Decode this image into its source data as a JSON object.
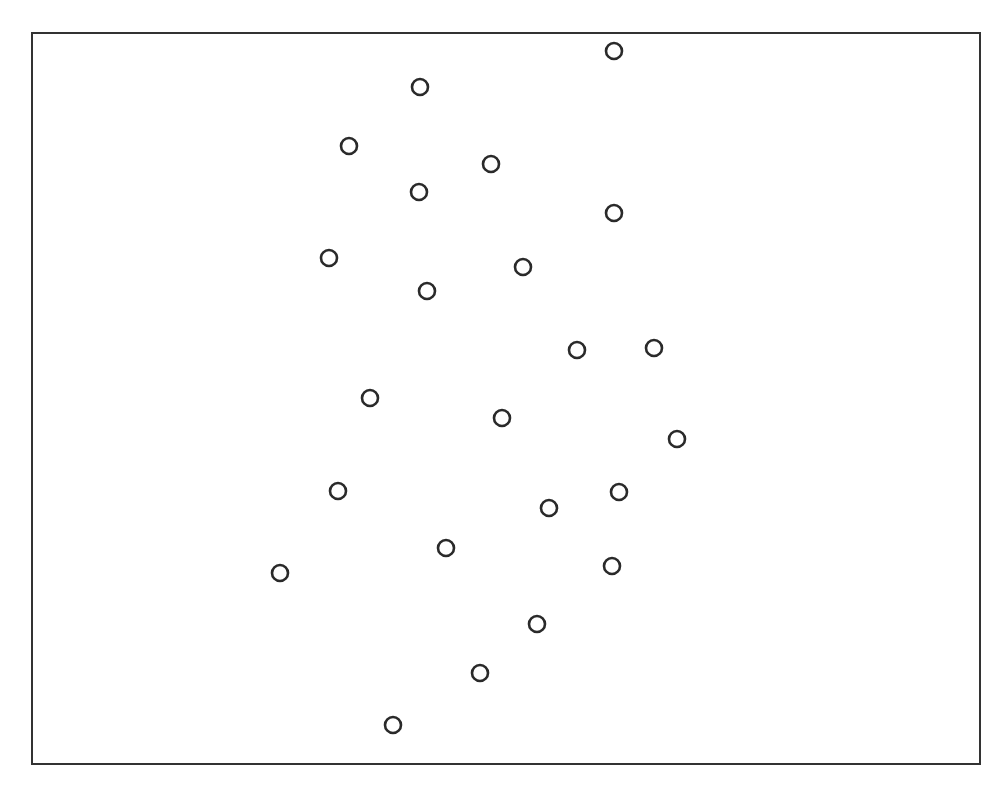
{
  "figure": {
    "type": "dot-pattern",
    "frame": {
      "x": 31,
      "y": 32,
      "width": 950,
      "height": 733,
      "stroke": "#333333"
    },
    "marker": {
      "shape": "open-circle",
      "radius": 8,
      "stroke_width": 2.6,
      "stroke": "#2a2a2a",
      "fill": "#ffffff"
    },
    "point_count": 23,
    "points": [
      {
        "x": 614,
        "y": 51
      },
      {
        "x": 420,
        "y": 87
      },
      {
        "x": 349,
        "y": 146
      },
      {
        "x": 491,
        "y": 164
      },
      {
        "x": 419,
        "y": 192
      },
      {
        "x": 614,
        "y": 213
      },
      {
        "x": 329,
        "y": 258
      },
      {
        "x": 523,
        "y": 267
      },
      {
        "x": 427,
        "y": 291
      },
      {
        "x": 577,
        "y": 350
      },
      {
        "x": 654,
        "y": 348
      },
      {
        "x": 370,
        "y": 398
      },
      {
        "x": 502,
        "y": 418
      },
      {
        "x": 677,
        "y": 439
      },
      {
        "x": 338,
        "y": 491
      },
      {
        "x": 619,
        "y": 492
      },
      {
        "x": 549,
        "y": 508
      },
      {
        "x": 446,
        "y": 548
      },
      {
        "x": 280,
        "y": 573
      },
      {
        "x": 612,
        "y": 566
      },
      {
        "x": 537,
        "y": 624
      },
      {
        "x": 480,
        "y": 673
      },
      {
        "x": 393,
        "y": 725
      }
    ]
  }
}
